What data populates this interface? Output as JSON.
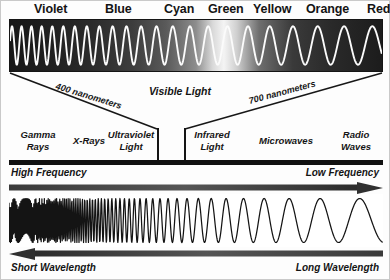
{
  "diagram": {
    "colors": {
      "band_background_dark": "#1d1d1d",
      "band_highlight": "#f2f2f2",
      "wave_stroke_light": "#f8f8f8",
      "wave_stroke_dark": "#141414",
      "bar_black": "#111111",
      "page_background": "#fdfdfd"
    }
  },
  "visible_colors": [
    {
      "label": "Violet",
      "x": 33
    },
    {
      "label": "Blue",
      "x": 104
    },
    {
      "label": "Cyan",
      "x": 163
    },
    {
      "label": "Green",
      "x": 207
    },
    {
      "label": "Yellow",
      "x": 252
    },
    {
      "label": "Orange",
      "x": 305
    },
    {
      "label": "Red",
      "x": 366
    }
  ],
  "funnel": {
    "left_wavelength": "400 nanometers",
    "right_wavelength": "700 nanometers",
    "center_label": "Visible Light"
  },
  "em_regions": [
    {
      "label": "Gamma\nRays",
      "x": 8,
      "width": 58
    },
    {
      "label": "X-Rays",
      "x": 66,
      "width": 52
    },
    {
      "label": "Ultraviolet\nLight",
      "x": 104,
      "width": 54
    },
    {
      "label": "Infrared\nLight",
      "x": 185,
      "width": 54
    },
    {
      "label": "Microwaves",
      "x": 250,
      "width": 70
    },
    {
      "label": "Radio\nWaves",
      "x": 330,
      "width": 52
    }
  ],
  "frequency_axis": {
    "left_label": "High Frequency",
    "right_label": "Low Frequency",
    "arrow_direction": "right"
  },
  "wavelength_axis": {
    "left_label": "Short Wavelength",
    "right_label": "Long Wavelength",
    "arrow_direction": "left"
  },
  "chart_data": {
    "type": "line",
    "xlabel": "Wavelength / Frequency",
    "ylabel": "",
    "grid": false,
    "legend_position": "none",
    "annotations": [
      "400 nanometers",
      "700 nanometers",
      "Visible Light",
      "High Frequency",
      "Low Frequency",
      "Short Wavelength",
      "Long Wavelength"
    ],
    "categories": [
      "Gamma Rays",
      "X-Rays",
      "Ultraviolet Light",
      "Visible Light",
      "Infrared Light",
      "Microwaves",
      "Radio Waves"
    ],
    "series": [
      {
        "name": "Visible spectrum wave (top band)",
        "description": "White sine wave over dark gradient; wavelength increases left to right across violet-to-red",
        "x": [
          0,
          0.14,
          0.3,
          0.44,
          0.56,
          0.72,
          1.0
        ],
        "values": [
          400,
          450,
          490,
          520,
          570,
          610,
          700
        ]
      },
      {
        "name": "Full-spectrum wave (bottom)",
        "description": "Black sine wave on white; period grows from near-zero at left to very long at right",
        "x": [
          0,
          0.2,
          0.4,
          0.6,
          0.8,
          1.0
        ],
        "values": [
          1,
          4,
          10,
          22,
          42,
          70
        ]
      }
    ],
    "xlim": [
      0,
      1
    ],
    "ylim": [
      -1,
      1
    ]
  }
}
